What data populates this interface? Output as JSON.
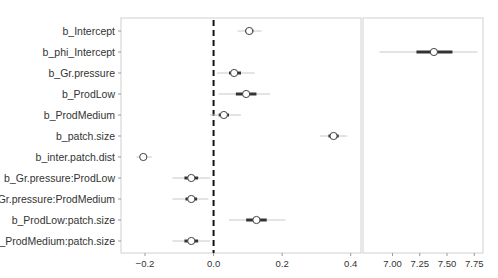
{
  "chart_data": {
    "type": "interval",
    "title": "",
    "xlabel": "",
    "ylabel": "",
    "grid": false,
    "legend": null,
    "reference_line": {
      "x": 0.0,
      "style": "dashed",
      "color": "#111111"
    },
    "panels": [
      {
        "name": "main",
        "xlim": [
          -0.27,
          0.43
        ],
        "xticks": [
          -0.2,
          0.0,
          0.2,
          0.4
        ],
        "xtick_labels": [
          "−0.2",
          "0.0",
          "0.2",
          "0.4"
        ]
      },
      {
        "name": "phi",
        "xlim": [
          6.73,
          7.83
        ],
        "xticks": [
          7.0,
          7.25,
          7.5,
          7.75
        ],
        "xtick_labels": [
          "7.00",
          "7.25",
          "7.50",
          "7.75"
        ]
      }
    ],
    "categories": [
      "b_Intercept",
      "b_phi_Intercept",
      "b_Gr.pressure",
      "b_ProdLow",
      "b_ProdMedium",
      "b_patch.size",
      "b_inter.patch.dist",
      "b_Gr.pressure:ProdLow",
      "b_Gr.pressure:ProdMedium",
      "b_ProdLow:patch.size",
      "b_ProdMedium:patch.size"
    ],
    "series": [
      {
        "name": "b_Intercept",
        "panel": 0,
        "estimate": 0.104,
        "inner": [
          0.092,
          0.116
        ],
        "outer": [
          0.07,
          0.14
        ]
      },
      {
        "name": "b_phi_Intercept",
        "panel": 1,
        "estimate": 7.38,
        "inner": [
          7.22,
          7.55
        ],
        "outer": [
          6.88,
          7.78
        ]
      },
      {
        "name": "b_Gr.pressure",
        "panel": 0,
        "estimate": 0.06,
        "inner": [
          0.045,
          0.08
        ],
        "outer": [
          0.01,
          0.12
        ]
      },
      {
        "name": "b_ProdLow",
        "panel": 0,
        "estimate": 0.095,
        "inner": [
          0.065,
          0.125
        ],
        "outer": [
          0.015,
          0.165
        ]
      },
      {
        "name": "b_ProdMedium",
        "panel": 0,
        "estimate": 0.03,
        "inner": [
          0.015,
          0.045
        ],
        "outer": [
          -0.01,
          0.08
        ]
      },
      {
        "name": "b_patch.size",
        "panel": 0,
        "estimate": 0.35,
        "inner": [
          0.335,
          0.365
        ],
        "outer": [
          0.31,
          0.39
        ]
      },
      {
        "name": "b_inter.patch.dist",
        "panel": 0,
        "estimate": -0.205,
        "inner": [
          -0.215,
          -0.195
        ],
        "outer": [
          -0.225,
          -0.18
        ]
      },
      {
        "name": "b_Gr.pressure:ProdLow",
        "panel": 0,
        "estimate": -0.065,
        "inner": [
          -0.085,
          -0.045
        ],
        "outer": [
          -0.12,
          -0.01
        ]
      },
      {
        "name": "b_Gr.pressure:ProdMedium",
        "panel": 0,
        "estimate": -0.065,
        "inner": [
          -0.082,
          -0.048
        ],
        "outer": [
          -0.12,
          -0.015
        ]
      },
      {
        "name": "b_ProdLow:patch.size",
        "panel": 0,
        "estimate": 0.125,
        "inner": [
          0.095,
          0.155
        ],
        "outer": [
          0.045,
          0.21
        ]
      },
      {
        "name": "b_ProdMedium:patch.size",
        "panel": 0,
        "estimate": -0.065,
        "inner": [
          -0.085,
          -0.045
        ],
        "outer": [
          -0.12,
          -0.01
        ]
      }
    ]
  },
  "colors": {
    "outer_line": "#c8c8c8",
    "inner_line": "#333333",
    "point_fill": "#ffffff",
    "point_stroke": "#444444",
    "panel_border": "#d0d0d0",
    "ref_line": "#111111",
    "text": "#333333"
  }
}
